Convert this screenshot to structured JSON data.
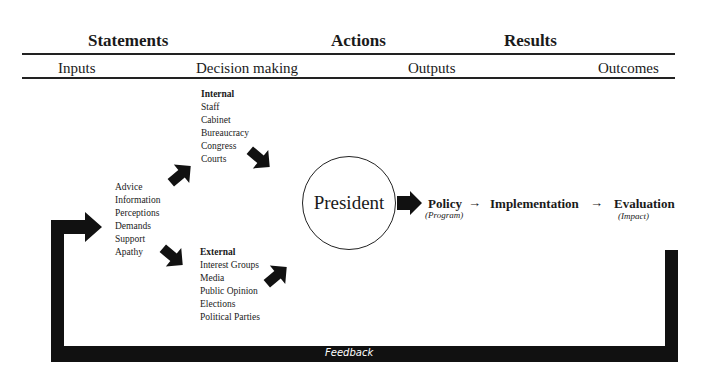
{
  "header": {
    "columns": [
      "Statements",
      "Actions",
      "Results"
    ],
    "subcolumns": [
      "Inputs",
      "Decision making",
      "Outputs",
      "Outcomes"
    ]
  },
  "inputs": {
    "items": [
      "Advice",
      "Information",
      "Perceptions",
      "Demands",
      "Support",
      "Apathy"
    ]
  },
  "internal": {
    "title": "Internal",
    "items": [
      "Staff",
      "Cabinet",
      "Bureaucracy",
      "Congress",
      "Courts"
    ]
  },
  "external": {
    "title": "External",
    "items": [
      "Interest Groups",
      "Media",
      "Public Opinion",
      "Elections",
      "Political Parties"
    ]
  },
  "center": {
    "label": "President"
  },
  "outputs": {
    "policy": "Policy",
    "policy_note": "(Program)",
    "implementation": "Implementation",
    "evaluation": "Evaluation",
    "evaluation_note": "(Impact)",
    "arrow_glyph": "→"
  },
  "feedback": {
    "label": "Feedback"
  },
  "colors": {
    "ink": "#1a1a1a",
    "background": "#ffffff"
  }
}
